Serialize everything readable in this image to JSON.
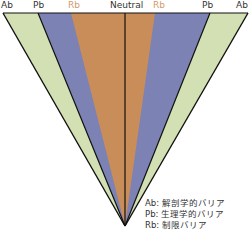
{
  "top_labels": {
    "left_ab": "Ab",
    "left_pb": "Pb",
    "left_rb": "Rb",
    "center": "Neutral",
    "right_rb": "Rb",
    "right_pb": "Pb",
    "right_ab": "Ab"
  },
  "legend": [
    {
      "key": "Ab",
      "sep": ": ",
      "text": "解剖学的バリア"
    },
    {
      "key": "Pb",
      "sep": ": ",
      "text": "生理学的バリア"
    },
    {
      "key": "Rb",
      "sep": ": ",
      "text": "制限バリア"
    }
  ],
  "colors": {
    "ab": "#d3e0b3",
    "pb": "#7d82b5",
    "rb": "#c98d5a",
    "line": "#111111",
    "rb_label": "#d59a6a"
  }
}
